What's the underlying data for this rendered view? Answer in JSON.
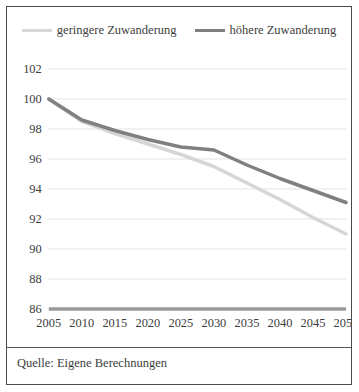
{
  "legend": {
    "position": "top-center",
    "entries": [
      {
        "label": "geringere Zuwanderung",
        "color": "#d6d6d6",
        "key": "geringere"
      },
      {
        "label": "höhere Zuwanderung",
        "color": "#808080",
        "key": "hoehere"
      }
    ]
  },
  "source": {
    "text": "Quelle: Eigene Berechnungen"
  },
  "chart_data": {
    "type": "line",
    "title": "",
    "subtitle": "",
    "xlabel": "",
    "ylabel": "",
    "x": [
      2005,
      2010,
      2015,
      2020,
      2025,
      2030,
      2035,
      2040,
      2045,
      2050
    ],
    "xtick_labels": [
      "2005",
      "2010",
      "2015",
      "2020",
      "2025",
      "2030",
      "2035",
      "2040",
      "2045",
      "2050"
    ],
    "xlim": [
      2005,
      2050
    ],
    "ylim": [
      86,
      102
    ],
    "yticks": [
      86,
      88,
      90,
      92,
      94,
      96,
      98,
      100,
      102
    ],
    "ytick_labels": [
      "86",
      "88",
      "90",
      "92",
      "94",
      "96",
      "98",
      "100",
      "102"
    ],
    "grid": true,
    "grid_axis": "y",
    "legend": [
      "geringere Zuwanderung",
      "höhere Zuwanderung"
    ],
    "legend_position": "top-center",
    "series": [
      {
        "name": "geringere Zuwanderung",
        "color": "#d6d6d6",
        "line_width": 3.5,
        "values": [
          100.0,
          98.5,
          97.7,
          97.0,
          96.3,
          95.5,
          94.4,
          93.3,
          92.1,
          91.0
        ]
      },
      {
        "name": "höhere Zuwanderung",
        "color": "#808080",
        "line_width": 3.5,
        "values": [
          100.0,
          98.6,
          97.9,
          97.3,
          96.8,
          96.6,
          95.6,
          94.7,
          93.9,
          93.1
        ]
      }
    ]
  },
  "axis_style": {
    "grid_color": "#e2e2e2",
    "baseline_color": "#9a9a9a",
    "tick_label_color": "#3d3d3d",
    "frame_color": "#4a4a4a"
  }
}
